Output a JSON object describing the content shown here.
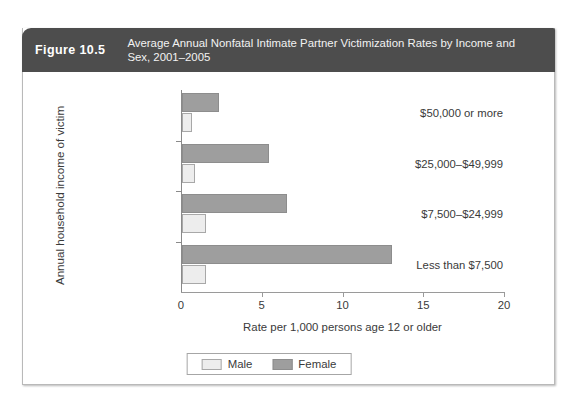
{
  "header": {
    "figure_number": "Figure 10.5",
    "title": "Average Annual Nonfatal Intimate Partner Victimization Rates by Income and Sex, 2001–2005"
  },
  "chart_data": {
    "type": "bar",
    "orientation": "horizontal",
    "title": "Average Annual Nonfatal Intimate Partner Victimization Rates by Income and Sex, 2001–2005",
    "xlabel": "Rate per 1,000 persons age 12 or older",
    "ylabel": "Annual household income of victim",
    "categories": [
      "$50,000 or more",
      "$25,000–$49,999",
      "$7,500–$24,999",
      "Less than $7,500"
    ],
    "series": [
      {
        "name": "Female",
        "color": "#9e9e9e",
        "values": [
          2.3,
          5.4,
          6.5,
          13.0
        ]
      },
      {
        "name": "Male",
        "color": "#ededed",
        "values": [
          0.6,
          0.8,
          1.5,
          1.5
        ]
      }
    ],
    "xlim": [
      0,
      20
    ],
    "xticks": [
      0,
      5,
      10,
      15,
      20
    ],
    "xticklabels": [
      "0",
      "5",
      "10",
      "15",
      "20"
    ],
    "grid": false,
    "legend_position": "bottom-center"
  },
  "legend": {
    "items": [
      {
        "label": "Male",
        "swatch": "male"
      },
      {
        "label": "Female",
        "swatch": "female"
      }
    ]
  }
}
